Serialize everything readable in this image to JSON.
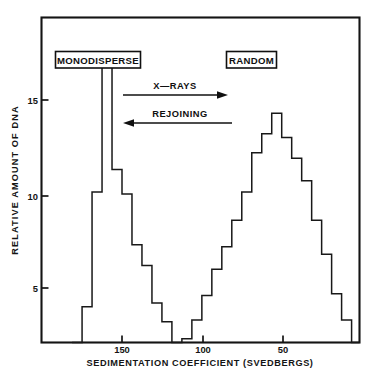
{
  "chart_data": {
    "type": "line",
    "title": "",
    "subtitle": "",
    "xlabel": "SEDIMENTATION COEFFICIENT (SVEDBERGS)",
    "ylabel": "RELATIVE AMOUNT OF DNA",
    "xlim": [
      181,
      16
    ],
    "ylim": [
      0,
      17.5
    ],
    "x_ticks": [
      150,
      100,
      50
    ],
    "x_tick_labels": [
      "150",
      "100",
      "50"
    ],
    "y_ticks": [
      5,
      10,
      15
    ],
    "y_tick_labels": [
      "5",
      "10",
      "15"
    ],
    "grid": false,
    "legend": false,
    "axis_direction": "x decreasing left to right",
    "note": "Step histogram of two DNA populations: a narrow monodisperse peak (clipped at top of frame) and a broad random-distribution peak.",
    "bin_width_svedbergs": 6.2,
    "series": [
      {
        "name": "DNA sedimentation profile",
        "color": "#181818",
        "style": "step",
        "x_bin_left_svedbergs": [
          181.0,
          174.8,
          168.6,
          162.4,
          156.2,
          150.0,
          143.8,
          137.6,
          131.4,
          125.2,
          119.0,
          112.8,
          106.6,
          100.4,
          94.2,
          88.0,
          81.8,
          75.6,
          69.4,
          63.2,
          57.0,
          50.8,
          44.6,
          38.4,
          32.2,
          26.0,
          19.8
        ],
        "values": [
          0,
          4.0,
          10.1,
          17.5,
          11.3,
          10.0,
          7.3,
          6.2,
          4.2,
          3.2,
          1.0,
          2.3,
          3.3,
          4.6,
          6.0,
          7.2,
          8.6,
          10.1,
          12.2,
          13.2,
          14.3,
          13.0,
          11.9,
          10.7,
          8.6,
          6.8,
          4.7
        ],
        "values_note": "peak at left bin is clipped by the frame top; right-hand tail falls to 3.3, 2.0, 0.9, 0 near the right frame edge",
        "tail_values": [
          3.3,
          2.0,
          0.9,
          0.0
        ]
      }
    ],
    "annotations": [
      {
        "name": "monodisperse-label",
        "text": "MONODISPERSE",
        "boxed": true
      },
      {
        "name": "random-label",
        "text": "RANDOM",
        "boxed": true
      },
      {
        "name": "xrays-arrow",
        "text": "X—RAYS",
        "direction": "right"
      },
      {
        "name": "rejoining-arrow",
        "text": "REJOINING",
        "direction": "left"
      }
    ]
  },
  "colors": {
    "ink": "#141414",
    "background": "#ffffff",
    "histogram": "#181818"
  }
}
